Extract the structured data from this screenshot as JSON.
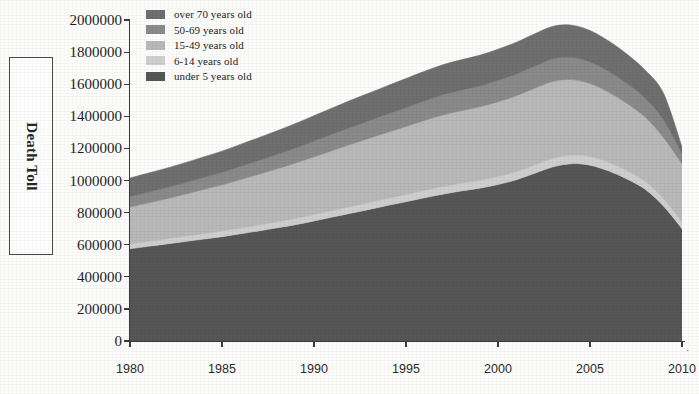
{
  "axes": {
    "ylabel": "Death Toll",
    "ytitle_suffix": "",
    "ytick_labels": [
      "0",
      "200000",
      "400000",
      "600000",
      "800000",
      "1000000",
      "1200000",
      "1400000",
      "1600000",
      "1800000",
      "2000000"
    ],
    "xtick_labels": [
      "1980",
      "1985",
      "1990",
      "1995",
      "2000",
      "2005",
      "2010"
    ],
    "x_trailing_mark": "·"
  },
  "legend": {
    "items": [
      {
        "label": "over 70 years old",
        "color": "#6f6f6f"
      },
      {
        "label": "50-69 years old",
        "color": "#8a8a8a"
      },
      {
        "label": "15-49 years old",
        "color": "#b9b9b9"
      },
      {
        "label": "6-14 years old",
        "color": "#cfcfcf"
      },
      {
        "label": "under 5 years old",
        "color": "#565656"
      }
    ]
  },
  "chart_data": {
    "type": "area",
    "stacked": true,
    "title": "",
    "xlabel": "",
    "ylabel": "Death Toll",
    "xlim": [
      1980,
      2010
    ],
    "ylim": [
      0,
      2000000
    ],
    "ytick_step": 200000,
    "xtick_step": 5,
    "grid": false,
    "legend_position": "top-left-inside",
    "x": [
      1980,
      1981,
      1982,
      1983,
      1984,
      1985,
      1986,
      1987,
      1988,
      1989,
      1990,
      1991,
      1992,
      1993,
      1994,
      1995,
      1996,
      1997,
      1998,
      1999,
      2000,
      2001,
      2002,
      2003,
      2004,
      2005,
      2006,
      2007,
      2008,
      2009,
      2010
    ],
    "series": [
      {
        "name": "under 5 years old",
        "color": "#565656",
        "values": [
          575000,
          590000,
          605000,
          620000,
          635000,
          650000,
          668000,
          686000,
          705000,
          725000,
          748000,
          772000,
          796000,
          820000,
          845000,
          868000,
          892000,
          915000,
          935000,
          952000,
          975000,
          1005000,
          1045000,
          1085000,
          1105000,
          1095000,
          1060000,
          1010000,
          945000,
          840000,
          700000
        ]
      },
      {
        "name": "6-14 years old",
        "color": "#cfcfcf",
        "values": [
          30000,
          31000,
          32000,
          33000,
          34000,
          35000,
          36000,
          37000,
          38000,
          39000,
          40000,
          41000,
          42000,
          43000,
          44000,
          45000,
          46000,
          47000,
          48000,
          49000,
          50000,
          51000,
          52000,
          53000,
          54000,
          54000,
          53000,
          52000,
          50000,
          47000,
          44000
        ]
      },
      {
        "name": "15-49 years old",
        "color": "#b9b9b9",
        "values": [
          230000,
          240000,
          250000,
          262000,
          275000,
          288000,
          302000,
          316000,
          330000,
          345000,
          360000,
          374000,
          388000,
          400000,
          412000,
          424000,
          436000,
          446000,
          452000,
          458000,
          466000,
          472000,
          478000,
          480000,
          470000,
          455000,
          438000,
          420000,
          400000,
          380000,
          360000
        ]
      },
      {
        "name": "50-69 years old",
        "color": "#8a8a8a",
        "values": [
          65000,
          67000,
          69000,
          72000,
          75000,
          78000,
          82000,
          86000,
          90000,
          94000,
          98000,
          102000,
          106000,
          110000,
          114000,
          118000,
          122000,
          126000,
          128000,
          130000,
          133000,
          136000,
          139000,
          141000,
          139000,
          135000,
          130000,
          124000,
          118000,
          110000,
          65000
        ]
      },
      {
        "name": "over 70 years old",
        "color": "#6f6f6f",
        "values": [
          115000,
          118000,
          121000,
          124000,
          128000,
          132000,
          137000,
          142000,
          147000,
          152000,
          158000,
          163000,
          168000,
          172000,
          176000,
          180000,
          184000,
          187000,
          189000,
          191000,
          194000,
          197000,
          200000,
          202000,
          200000,
          195000,
          189000,
          182000,
          174000,
          165000,
          41000
        ]
      }
    ],
    "totals": [
      1015000,
      1046000,
      1077000,
      1111000,
      1147000,
      1183000,
      1225000,
      1267000,
      1310000,
      1355000,
      1404000,
      1452000,
      1500000,
      1545000,
      1591000,
      1635000,
      1680000,
      1721000,
      1752000,
      1780000,
      1818000,
      1861000,
      1914000,
      1961000,
      1968000,
      1934000,
      1870000,
      1788000,
      1687000,
      1542000,
      1210000
    ],
    "peak": {
      "year": 2003.5,
      "value": 1820000
    }
  }
}
